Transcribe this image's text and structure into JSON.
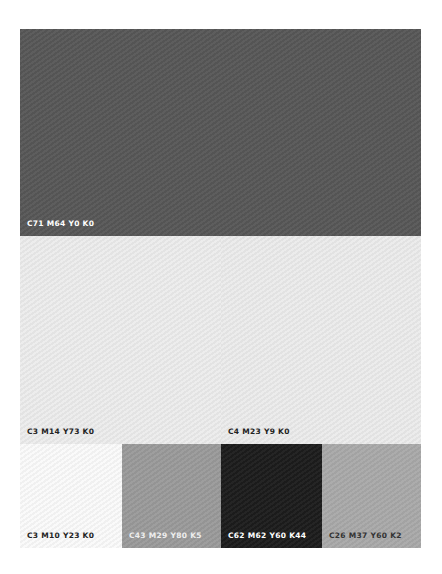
{
  "palette": {
    "swatches": [
      {
        "id": "top",
        "label": "C71 M64 Y0 K0",
        "color": "#575757",
        "text_color": "#ffffff"
      },
      {
        "id": "mid-l",
        "label": "C3 M14 Y73 K0",
        "color": "#ececec",
        "text_color": "#222222"
      },
      {
        "id": "mid-r",
        "label": "C4 M23 Y9 K0",
        "color": "#ebebeb",
        "text_color": "#222222"
      },
      {
        "id": "b1",
        "label": "C3 M10 Y23 K0",
        "color": "#fafafa",
        "text_color": "#222222"
      },
      {
        "id": "b2",
        "label": "C43 M29 Y80 K5",
        "color": "#9a9a9a",
        "text_color": "#eeeeee"
      },
      {
        "id": "b3",
        "label": "C62 M62 Y60 K44",
        "color": "#1c1c1c",
        "text_color": "#ffffff"
      },
      {
        "id": "b4",
        "label": "C26 M37 Y60 K2",
        "color": "#a9a9a9",
        "text_color": "#333333"
      }
    ]
  }
}
